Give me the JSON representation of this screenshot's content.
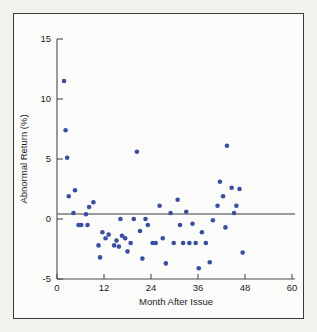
{
  "chart_data": {
    "type": "scatter",
    "title": "",
    "xlabel": "Month After Issue",
    "ylabel": "Abnormal Return (%)",
    "xlim": [
      0,
      60
    ],
    "ylim": [
      -5,
      15
    ],
    "xticks": [
      0,
      12,
      24,
      36,
      48,
      60
    ],
    "yticks": [
      -5,
      0,
      5,
      10,
      15
    ],
    "xtick_labels": [
      "0",
      "12",
      "24",
      "36",
      "48",
      "60"
    ],
    "ytick_labels": [
      "-5",
      "0",
      "5",
      "10",
      "15"
    ],
    "grid": false,
    "legend": null,
    "series_color": "#3b4fa0",
    "reference_lines": [
      {
        "axis": "y",
        "value": 0
      }
    ],
    "points": [
      {
        "x": 1.8,
        "y": 11.5
      },
      {
        "x": 2.2,
        "y": 7.4
      },
      {
        "x": 2.6,
        "y": 5.1
      },
      {
        "x": 3.0,
        "y": 1.9
      },
      {
        "x": 4.6,
        "y": 2.4
      },
      {
        "x": 4.2,
        "y": 0.5
      },
      {
        "x": 5.5,
        "y": -0.5
      },
      {
        "x": 6.2,
        "y": -0.5
      },
      {
        "x": 7.8,
        "y": -0.5
      },
      {
        "x": 7.4,
        "y": 0.4
      },
      {
        "x": 8.2,
        "y": 1.0
      },
      {
        "x": 9.3,
        "y": 1.4
      },
      {
        "x": 10.6,
        "y": -2.2
      },
      {
        "x": 11.0,
        "y": -3.2
      },
      {
        "x": 11.6,
        "y": -1.1
      },
      {
        "x": 12.4,
        "y": -1.6
      },
      {
        "x": 13.2,
        "y": -1.3
      },
      {
        "x": 14.6,
        "y": -2.2
      },
      {
        "x": 15.2,
        "y": -1.8
      },
      {
        "x": 15.8,
        "y": -2.3
      },
      {
        "x": 16.6,
        "y": -1.4
      },
      {
        "x": 17.4,
        "y": -1.6
      },
      {
        "x": 18.0,
        "y": -2.7
      },
      {
        "x": 16.2,
        "y": 0.0
      },
      {
        "x": 19.6,
        "y": 0.0
      },
      {
        "x": 20.4,
        "y": 5.6
      },
      {
        "x": 21.2,
        "y": -1.0
      },
      {
        "x": 21.8,
        "y": -3.3
      },
      {
        "x": 22.6,
        "y": 0.0
      },
      {
        "x": 23.2,
        "y": -0.5
      },
      {
        "x": 24.4,
        "y": -2.0
      },
      {
        "x": 25.2,
        "y": -2.0
      },
      {
        "x": 26.2,
        "y": 1.1
      },
      {
        "x": 27.0,
        "y": -1.6
      },
      {
        "x": 27.8,
        "y": -3.7
      },
      {
        "x": 29.0,
        "y": 0.5
      },
      {
        "x": 29.8,
        "y": -2.0
      },
      {
        "x": 30.8,
        "y": 1.6
      },
      {
        "x": 31.4,
        "y": -0.5
      },
      {
        "x": 32.2,
        "y": -2.0
      },
      {
        "x": 33.0,
        "y": 0.6
      },
      {
        "x": 33.8,
        "y": -2.0
      },
      {
        "x": 34.6,
        "y": -0.4
      },
      {
        "x": 35.4,
        "y": -2.0
      },
      {
        "x": 36.2,
        "y": -4.1
      },
      {
        "x": 37.0,
        "y": -1.1
      },
      {
        "x": 38.0,
        "y": -2.0
      },
      {
        "x": 39.0,
        "y": -3.6
      },
      {
        "x": 39.8,
        "y": -0.1
      },
      {
        "x": 41.0,
        "y": 1.1
      },
      {
        "x": 41.6,
        "y": 3.1
      },
      {
        "x": 42.4,
        "y": 1.9
      },
      {
        "x": 43.4,
        "y": 6.1
      },
      {
        "x": 43.0,
        "y": -0.7
      },
      {
        "x": 44.6,
        "y": 2.6
      },
      {
        "x": 45.2,
        "y": 0.5
      },
      {
        "x": 45.8,
        "y": 1.1
      },
      {
        "x": 46.6,
        "y": 2.5
      },
      {
        "x": 47.4,
        "y": -2.8
      },
      {
        "x": 18.8,
        "y": -2.0
      }
    ]
  },
  "axis": {
    "y_title": "Abnormal Return (%)",
    "x_title": "Month After Issue"
  }
}
